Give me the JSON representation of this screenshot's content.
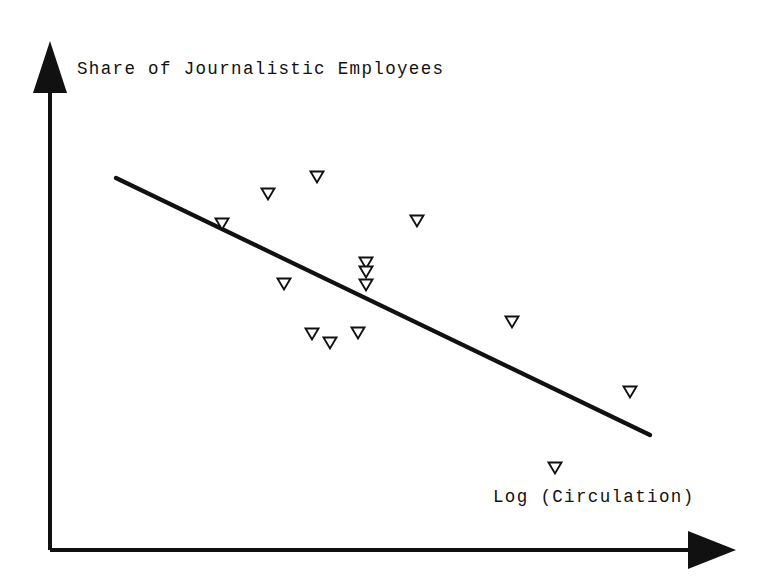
{
  "figure": {
    "background_color": "#ffffff",
    "ink_color": "#111111",
    "width": 773,
    "height": 584
  },
  "axes": {
    "y_axis_label": "Share of Journalistic Employees",
    "x_axis_label": "Log (Circulation)",
    "y_axis_name": "y-axis-arrow",
    "x_axis_name": "x-axis-arrow",
    "origin_px": [
      50,
      550
    ],
    "y_tip_px": [
      50,
      42
    ],
    "x_tip_px": [
      735,
      550
    ],
    "ticks_shown": false,
    "tick_labels": []
  },
  "chart_data": {
    "type": "scatter",
    "title": "",
    "subtitle": "",
    "xlabel": "Log (Circulation)",
    "ylabel": "Share of Journalistic Employees",
    "grid": false,
    "legend": false,
    "legend_position": "none",
    "axis_ticks": false,
    "marker_style": "hollow-down-triangle",
    "marker_glyph": "triangle-down-icon",
    "xlim": [
      0,
      1
    ],
    "ylim": [
      0,
      1
    ],
    "note": "Axes are unlabeled schematic arrows; values are normalized 0-1 positions read off the plotting area.",
    "points_px": [
      [
        222,
        224
      ],
      [
        268,
        194
      ],
      [
        317,
        177
      ],
      [
        417,
        221
      ],
      [
        284,
        284
      ],
      [
        366,
        263
      ],
      [
        366,
        272
      ],
      [
        366,
        285
      ],
      [
        312,
        334
      ],
      [
        330,
        343
      ],
      [
        358,
        333
      ],
      [
        512,
        322
      ],
      [
        630,
        392
      ],
      [
        555,
        468
      ]
    ],
    "x": [
      0.251,
      0.318,
      0.39,
      0.536,
      0.341,
      0.461,
      0.461,
      0.461,
      0.382,
      0.409,
      0.45,
      0.674,
      0.847,
      0.737
    ],
    "y": [
      0.642,
      0.701,
      0.734,
      0.648,
      0.524,
      0.565,
      0.547,
      0.522,
      0.425,
      0.407,
      0.427,
      0.449,
      0.311,
      0.162
    ],
    "n_points": 14,
    "series": [
      {
        "name": "newspapers",
        "marker": "triangle-down-open",
        "x": [
          0.251,
          0.318,
          0.39,
          0.536,
          0.341,
          0.461,
          0.461,
          0.461,
          0.382,
          0.409,
          0.45,
          0.674,
          0.847,
          0.737
        ],
        "y": [
          0.642,
          0.701,
          0.734,
          0.648,
          0.524,
          0.565,
          0.547,
          0.522,
          0.425,
          0.407,
          0.427,
          0.449,
          0.311,
          0.162
        ]
      }
    ],
    "trendline": {
      "name": "fitted-regression-line",
      "type": "linear",
      "start_px": [
        116,
        178
      ],
      "end_px": [
        650,
        435
      ],
      "slope_sign": "negative",
      "slope_px_per_px": -0.481,
      "relationship": "Share of journalistic employees decreases as log circulation increases"
    }
  },
  "markers": {
    "marker_width_px": 13,
    "marker_height_px": 11,
    "stroke_width_px": 1.9,
    "fill": "#ffffff",
    "stroke": "#111111"
  }
}
